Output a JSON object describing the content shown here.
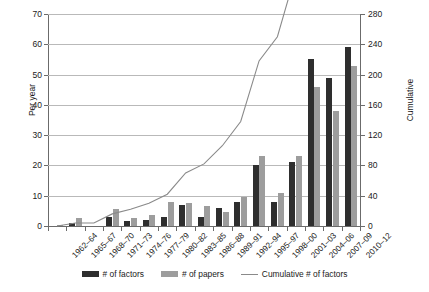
{
  "chart_data": {
    "type": "bar",
    "title": "",
    "xlabel": "",
    "ylabel": "Per year",
    "y2label": "Cumulative",
    "ylim": [
      0,
      70
    ],
    "y2lim": [
      0,
      280
    ],
    "yticks": [
      0,
      10,
      20,
      30,
      40,
      50,
      60,
      70
    ],
    "y2ticks": [
      0,
      40,
      80,
      120,
      160,
      200,
      240,
      280
    ],
    "grid": true,
    "legend_position": "bottom",
    "categories": [
      "1962–64",
      "1965–67",
      "1968–70",
      "1971–73",
      "1974–76",
      "1977–79",
      "1980–82",
      "1983–85",
      "1986–88",
      "1989–91",
      "1992–94",
      "1995–97",
      "1998–00",
      "2001–03",
      "2004–06",
      "2007–09",
      "2010–12"
    ],
    "series": [
      {
        "name": "# of factors",
        "kind": "bar",
        "axis": "left",
        "color": "#2e2e2e",
        "values": [
          0,
          1,
          0,
          3,
          1.5,
          2,
          3,
          7,
          3,
          6,
          8,
          20,
          8,
          21,
          55,
          49,
          59
        ]
      },
      {
        "name": "# of papers",
        "kind": "bar",
        "axis": "left",
        "color": "#9d9d9d",
        "values": [
          0.5,
          2.5,
          0,
          5.5,
          2.5,
          3.5,
          8,
          7.5,
          6.5,
          4.5,
          9.5,
          23,
          11,
          23,
          46,
          38,
          53
        ]
      },
      {
        "name": "Cumulative # of factors",
        "kind": "line",
        "axis": "right",
        "color": "#8a8a8a",
        "values": [
          0,
          4,
          4,
          16,
          22,
          30,
          42,
          70,
          82,
          106,
          138,
          218,
          250,
          334,
          554,
          750,
          986
        ]
      }
    ]
  },
  "axes": {
    "left_title": "Per year",
    "right_title": "Cumulative",
    "left_ticks": [
      "70",
      "60",
      "50",
      "40",
      "30",
      "20",
      "10",
      "0"
    ],
    "right_ticks": [
      "280",
      "240",
      "200",
      "160",
      "120",
      "80",
      "40",
      "0"
    ]
  },
  "legend": {
    "items": [
      {
        "label": "# of factors",
        "marker": "bar-dark"
      },
      {
        "label": "# of papers",
        "marker": "bar-gray"
      },
      {
        "label": "Cumulative # of factors",
        "marker": "line"
      }
    ]
  }
}
